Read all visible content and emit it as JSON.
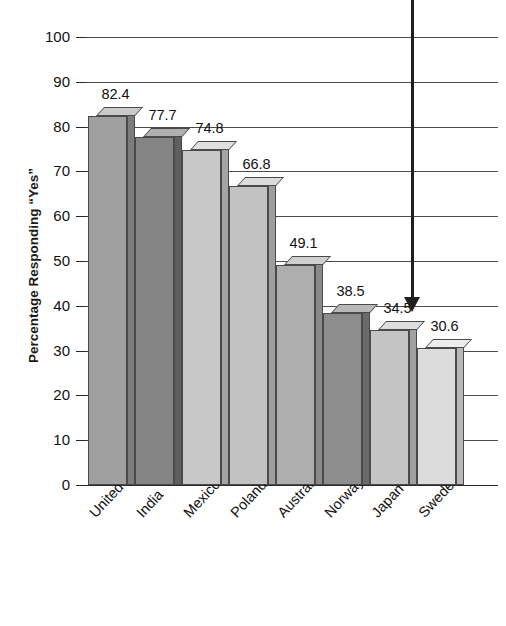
{
  "title": "...AND SHARE SHOT",
  "chart_data": {
    "type": "bar",
    "title": "...AND SHARE SHOT",
    "xlabel": "",
    "ylabel": "Percentage Responding “Yes”",
    "ylim": [
      0,
      100
    ],
    "yticks": [
      0,
      10,
      20,
      30,
      40,
      50,
      60,
      70,
      80,
      90,
      100
    ],
    "ytick_labels": [
      "0",
      "10",
      "20",
      "30",
      "40",
      "50",
      "60",
      "70",
      "80",
      "90",
      "100"
    ],
    "grid": true,
    "legend": "none",
    "categories": [
      "United States",
      "India",
      "Mexico",
      "Poland",
      "Australia",
      "Norway",
      "Japan",
      "Sweden"
    ],
    "values": [
      82.4,
      77.7,
      74.8,
      66.8,
      49.1,
      38.5,
      34.5,
      30.6
    ],
    "value_labels": [
      "82.4",
      "77.7",
      "74.8",
      "66.8",
      "49.1",
      "38.5",
      "34.5",
      "30.6"
    ],
    "bar_colors": [
      "#a0a0a0",
      "#848484",
      "#c8c8c8",
      "#c2c2c2",
      "#aeaeae",
      "#8d8d8d",
      "#c4c4c4",
      "#dcdcdc"
    ],
    "bar_top_colors": [
      "#c9c9c9",
      "#b0b0b0",
      "#e0e0e0",
      "#dcdcdc",
      "#cfcfcf",
      "#b8b8b8",
      "#dedede",
      "#ededed"
    ],
    "bar_side_colors": [
      "#7c7c7c",
      "#5f5f5f",
      "#a4a4a4",
      "#9e9e9e",
      "#8a8a8a",
      "#6b6b6b",
      "#a0a0a0",
      "#b8b8b8"
    ],
    "annotation": "downward-arrow"
  },
  "axis": {
    "y_caption": "Percentage Responding “Yes”"
  }
}
